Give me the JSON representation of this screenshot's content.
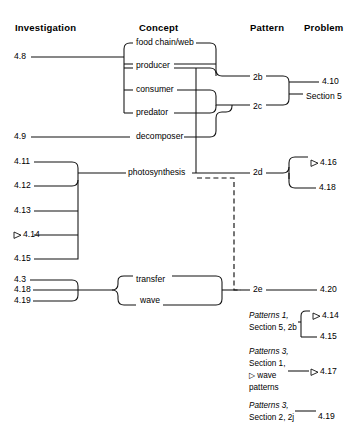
{
  "diagram": {
    "columns": [
      {
        "id": "investigation",
        "label": "Investigation"
      },
      {
        "id": "concept",
        "label": "Concept"
      },
      {
        "id": "pattern",
        "label": "Pattern"
      },
      {
        "id": "problem",
        "label": "Problem"
      }
    ],
    "investigations": [
      {
        "id": "i48",
        "label": "4.8",
        "marker": ""
      },
      {
        "id": "i49",
        "label": "4.9",
        "marker": ""
      },
      {
        "id": "i411",
        "label": "4.11",
        "marker": ""
      },
      {
        "id": "i412",
        "label": "4.12",
        "marker": ""
      },
      {
        "id": "i413",
        "label": "4.13",
        "marker": ""
      },
      {
        "id": "i414",
        "label": "4.14",
        "marker": "triangle"
      },
      {
        "id": "i415",
        "label": "4.15",
        "marker": ""
      },
      {
        "id": "i43",
        "label": "4.3",
        "marker": ""
      },
      {
        "id": "i418",
        "label": "4.18",
        "marker": ""
      },
      {
        "id": "i419",
        "label": "4.19",
        "marker": ""
      }
    ],
    "concepts": [
      {
        "id": "c1",
        "label": "food chain/web"
      },
      {
        "id": "c2",
        "label": "producer"
      },
      {
        "id": "c3",
        "label": "consumer"
      },
      {
        "id": "c4",
        "label": "predator"
      },
      {
        "id": "c5",
        "label": "decomposer"
      },
      {
        "id": "c6",
        "label": "photosynthesis"
      },
      {
        "id": "c7",
        "label": "transfer"
      },
      {
        "id": "c8",
        "label": "wave"
      }
    ],
    "patterns": [
      {
        "id": "p2b",
        "label": "2b"
      },
      {
        "id": "p2c",
        "label": "2c"
      },
      {
        "id": "p2d",
        "label": "2d"
      },
      {
        "id": "p2e",
        "label": "2e"
      }
    ],
    "problems": [
      {
        "id": "pr410",
        "label": "4.10",
        "marker": ""
      },
      {
        "id": "prs5",
        "label": "Section 5",
        "marker": ""
      },
      {
        "id": "pr416",
        "label": "4.16",
        "marker": "triangle"
      },
      {
        "id": "pr418",
        "label": "4.18",
        "marker": ""
      },
      {
        "id": "pr420",
        "label": "4.20",
        "marker": ""
      },
      {
        "id": "pr414",
        "label": "4.14",
        "marker": "triangle"
      },
      {
        "id": "pr415",
        "label": "4.15",
        "marker": ""
      },
      {
        "id": "pr417",
        "label": "4.17",
        "marker": "triangle"
      },
      {
        "id": "pr419",
        "label": "4.19",
        "marker": ""
      }
    ],
    "notes": [
      {
        "id": "n1",
        "lines": [
          "Patterns 1,",
          "Section 5, 2b"
        ],
        "italic_lines": [
          true,
          false
        ],
        "targets": [
          "4.14",
          "4.15"
        ]
      },
      {
        "id": "n2",
        "lines": [
          "Patterns 3,",
          "Section 1,",
          "▷ wave",
          "patterns"
        ],
        "italic_lines": [
          true,
          false,
          false,
          false
        ],
        "targets": [
          "4.17"
        ]
      },
      {
        "id": "n3",
        "lines": [
          "Patterns 3,",
          "Section 2, 2j"
        ],
        "italic_lines": [
          true,
          false
        ],
        "targets": [
          "4.19"
        ]
      }
    ],
    "legend": {
      "triangle_marker": "▷"
    },
    "colors": {
      "line": "#111111",
      "text": "#111111",
      "background": "#ffffff"
    }
  }
}
